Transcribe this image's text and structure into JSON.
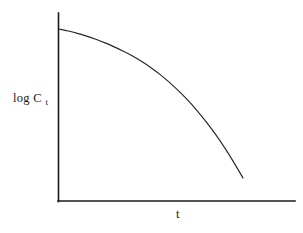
{
  "figure": {
    "background_color": "#ffffff",
    "line_color": "#262626",
    "axis_color": "#1a1a1a"
  },
  "axes": {
    "y_label_main": "log C",
    "y_label_subscript": "t",
    "x_label": "t"
  },
  "chart_data": {
    "type": "line",
    "title": "",
    "subtitle": "",
    "xlabel": "t",
    "ylabel": "log C_t",
    "grid": false,
    "legend": null,
    "xlim": [
      0,
      10
    ],
    "ylim": [
      0,
      10
    ],
    "axis_ticks": {
      "x": [],
      "y": []
    },
    "annotations": [],
    "series": [
      {
        "name": "log C_t",
        "x": [
          0.0,
          0.5,
          1.0,
          1.5,
          2.0,
          2.5,
          3.0,
          3.5,
          4.0,
          4.5,
          5.0,
          5.5,
          6.0,
          6.5,
          7.0,
          7.5,
          8.0,
          8.5,
          9.0,
          9.5,
          10.0
        ],
        "y": [
          9.16,
          9.06,
          8.94,
          8.8,
          8.64,
          8.46,
          8.26,
          8.04,
          7.8,
          7.52,
          7.21,
          6.86,
          6.47,
          6.04,
          5.57,
          5.05,
          4.48,
          3.86,
          3.18,
          2.44,
          1.65
        ]
      }
    ]
  }
}
